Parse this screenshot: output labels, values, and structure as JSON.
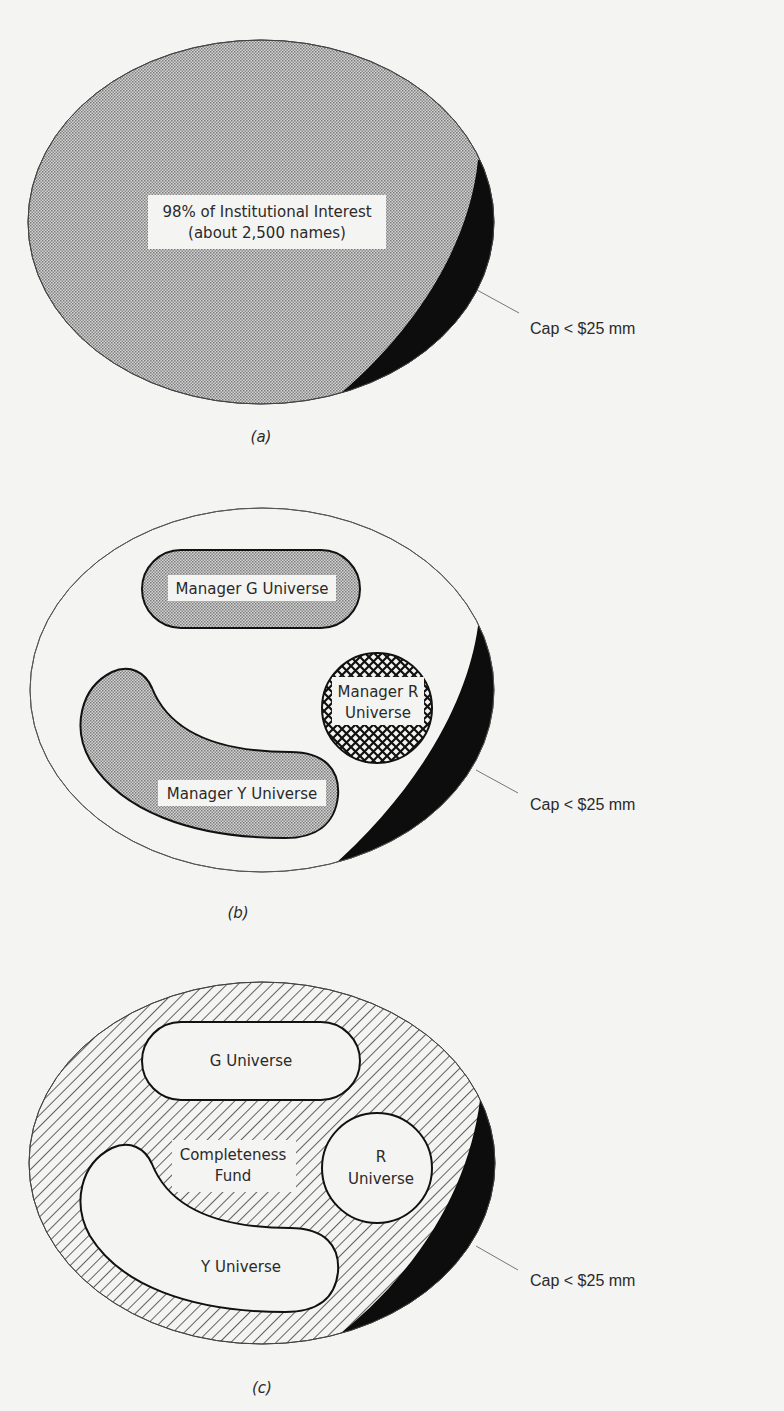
{
  "figure": {
    "panels": [
      {
        "id": "a",
        "caption": "(a)",
        "main_label_line1": "98% of Institutional Interest",
        "main_label_line2": "(about 2,500 names)",
        "callout": "Cap < $25 mm"
      },
      {
        "id": "b",
        "caption": "(b)",
        "g_label": "Manager G Universe",
        "r_label_line1": "Manager R",
        "r_label_line2": "Universe",
        "y_label": "Manager Y Universe",
        "callout": "Cap < $25 mm"
      },
      {
        "id": "c",
        "caption": "(c)",
        "g_label": "G Universe",
        "r_label_line1": "R",
        "r_label_line2": "Universe",
        "y_label": "Y Universe",
        "fund_label_line1": "Completeness",
        "fund_label_line2": "Fund",
        "callout": "Cap < $25 mm"
      }
    ]
  },
  "colors": {
    "background": "#f4f4f2",
    "stipple_fill": "#b9b9b9",
    "ink": "#111111",
    "leader_line": "#777777"
  }
}
